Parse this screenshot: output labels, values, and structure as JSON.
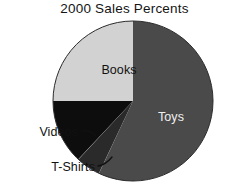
{
  "chart_data": {
    "type": "pie",
    "title": "2000 Sales Percents",
    "xlabel": "",
    "ylabel": "",
    "legend": "none",
    "grid": false,
    "labels": [
      "Toys",
      "Books",
      "T-Shirts",
      "Videos"
    ],
    "values": [
      57,
      25,
      5,
      13
    ],
    "colors": [
      "#4a4a4a",
      "#d2d2d2",
      "#2a2a2a",
      "#0d0d0d"
    ],
    "slices": [
      {
        "name": "Toys",
        "label": "Toys",
        "value": 57,
        "color": "#4a4a4a",
        "start_angle": 0,
        "end_angle": 205.2,
        "label_placement": "inside",
        "label_color": "#f2f2f2",
        "label_x": 171,
        "label_y": 117
      },
      {
        "name": "Books",
        "label": "Books",
        "value": 25,
        "color": "#d2d2d2",
        "start_angle": 270,
        "end_angle": 360,
        "label_placement": "inside",
        "label_color": "#111111",
        "label_x": 119,
        "label_y": 70
      },
      {
        "name": "T-Shirts",
        "label": "T-Shirts",
        "value": 5,
        "color": "#2a2a2a",
        "start_angle": 205.2,
        "end_angle": 223.2,
        "label_placement": "callout",
        "label_color": "#111111",
        "label_x": 58,
        "label_y": 168
      },
      {
        "name": "Videos",
        "label": "Videos",
        "value": 13,
        "color": "#0d0d0d",
        "start_angle": 223.2,
        "end_angle": 270,
        "label_placement": "callout",
        "label_color": "#111111",
        "label_x": 48,
        "label_y": 133
      }
    ],
    "geometry": {
      "center_x": 133,
      "center_y": 101,
      "radius": 80
    },
    "background": "#ffffff"
  },
  "figure": {
    "title": "2000 Sales Percents",
    "toys_label": "Toys",
    "books_label": "Books",
    "tshirts_label": "T-Shirts",
    "videos_label": "Videos"
  }
}
